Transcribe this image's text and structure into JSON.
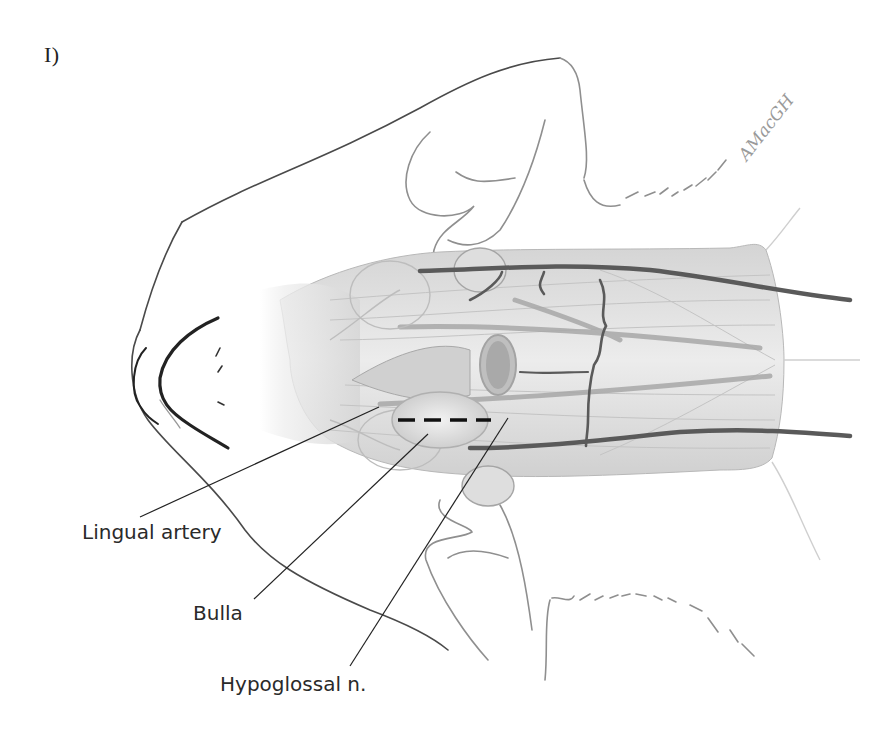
{
  "figure": {
    "panel_label": "I)",
    "signature": "AMacGH",
    "view": "ventral view of feline head and neck, surgical approach to the tympanic bulla",
    "labels": {
      "lingual_artery": "Lingual artery",
      "bulla": "Bulla",
      "hypoglossal_nerve": "Hypoglossal n."
    },
    "incision": {
      "style": "dashed",
      "color": "#111111",
      "from": [
        398,
        420
      ],
      "to": [
        491,
        420
      ]
    },
    "leaders": {
      "lingual_artery": {
        "from": [
          140,
          517
        ],
        "to": [
          379,
          407
        ]
      },
      "bulla": {
        "from": [
          254,
          599
        ],
        "to": [
          428,
          434
        ]
      },
      "hypoglossal_nerve": {
        "from": [
          350,
          666
        ],
        "to": [
          508,
          418
        ]
      }
    },
    "colors": {
      "outline": "#444444",
      "vessel": "#5a5a5a",
      "muscle": "#d9d9d9",
      "ear_outline": "#9a9a9a"
    }
  }
}
